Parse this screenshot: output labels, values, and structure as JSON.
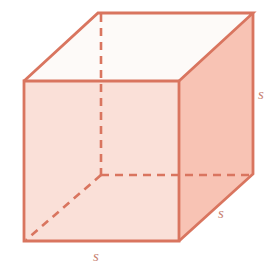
{
  "figure": {
    "name": "cube-diagram",
    "shape": "cube",
    "background_color": "#ffffff"
  },
  "colors": {
    "edge_visible": "#d9755f",
    "edge_hidden": "#d9755f",
    "face_front": "#fae0d8",
    "face_right": "#f8c3b4",
    "face_top": "#fdfaf8",
    "label_text": "#c98272"
  },
  "labels": {
    "width": "s",
    "height": "s",
    "depth": "s"
  },
  "geometry": {
    "front_top_left": [
      24,
      81
    ],
    "front_top_right": [
      179,
      81
    ],
    "front_bottom_right": [
      179,
      241
    ],
    "front_bottom_left": [
      24,
      241
    ],
    "back_top_left": [
      98,
      13
    ],
    "back_top_right": [
      253,
      13
    ],
    "back_bottom_right": [
      253,
      174
    ],
    "back_bottom_left": [
      102,
      175
    ],
    "hidden_edges": [
      "back_bottom_left-back_top_left",
      "back_bottom_left-back_bottom_right",
      "back_bottom_left-front_bottom_left"
    ]
  }
}
